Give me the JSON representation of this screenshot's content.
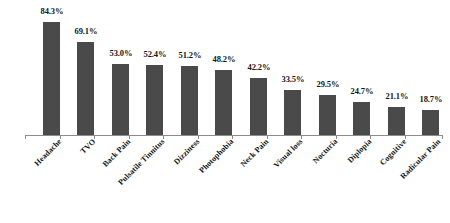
{
  "chart_data": {
    "type": "bar",
    "title": "",
    "subtitle": "",
    "xlabel": "",
    "ylabel": "",
    "ylim": [
      0,
      90
    ],
    "grid": false,
    "legend": false,
    "legend_position": "none",
    "orientation": "vertical",
    "value_label_format": "percent_one_decimal",
    "categories": [
      "Headache",
      "TVO",
      "Back Pain",
      "Pulsatile Tinnitus",
      "Dizziness",
      "Photophobia",
      "Neck Pain",
      "Visual loss",
      "Nocturia",
      "Diplopia",
      "Cognitive",
      "Radicular Pain"
    ],
    "values": [
      84.3,
      69.1,
      53.0,
      52.4,
      51.2,
      48.2,
      42.2,
      33.5,
      29.5,
      24.7,
      21.1,
      18.7
    ],
    "value_labels": [
      "84.3%",
      "69.1%",
      "53.0%",
      "52.4%",
      "51.2%",
      "48.2%",
      "42.2%",
      "33.5%",
      "29.5%",
      "24.7%",
      "21.1%",
      "18.7%"
    ],
    "colors": {
      "bar": "#4a4a4a",
      "axis": "#8c8c8c",
      "text": "#161616",
      "background": "#ffffff"
    }
  }
}
